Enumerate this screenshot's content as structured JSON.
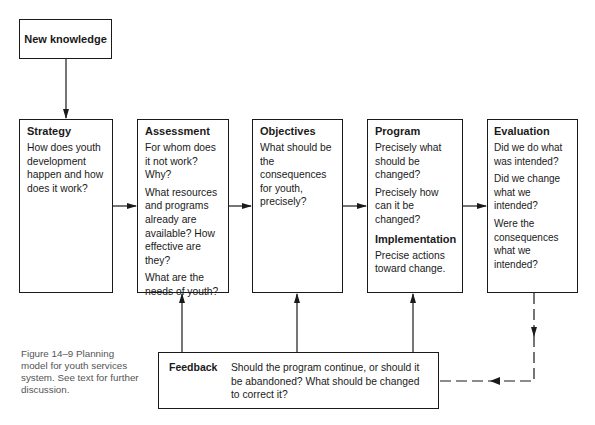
{
  "diagram": {
    "source": {
      "label": "New knowledge"
    },
    "stages": [
      {
        "title": "Strategy",
        "paragraphs": [
          "How does youth development happen and how does it work?"
        ]
      },
      {
        "title": "Assessment",
        "paragraphs": [
          "For whom does it not work? Why?",
          "What resources and programs already are available? How effective are they?",
          "What are the needs of youth?"
        ]
      },
      {
        "title": "Objectives",
        "paragraphs": [
          "What should be the consequences for youth, precisely?"
        ]
      },
      {
        "title": "Program",
        "paragraphs": [
          "Precisely what should be changed?",
          "Precisely how can it be changed?"
        ],
        "subsection": {
          "title": "Implementation",
          "paragraphs": [
            "Precise actions toward change."
          ]
        }
      },
      {
        "title": "Evaluation",
        "paragraphs": [
          "Did we do what was intended?",
          "Did we change what we intended?",
          "Were the consequences what we intended?"
        ]
      }
    ],
    "feedback": {
      "label": "Feedback",
      "text": "Should the program continue, or should it be abandoned? What should be changed to correct it?"
    },
    "edges": [
      {
        "from": "New knowledge",
        "to": "Strategy",
        "style": "solid"
      },
      {
        "from": "Strategy",
        "to": "Assessment",
        "style": "solid"
      },
      {
        "from": "Assessment",
        "to": "Objectives",
        "style": "solid"
      },
      {
        "from": "Objectives",
        "to": "Program",
        "style": "solid"
      },
      {
        "from": "Program",
        "to": "Evaluation",
        "style": "solid"
      },
      {
        "from": "Evaluation",
        "to": "Feedback",
        "style": "dashed"
      },
      {
        "from": "Feedback",
        "to": "Assessment",
        "style": "solid"
      },
      {
        "from": "Feedback",
        "to": "Objectives",
        "style": "solid"
      },
      {
        "from": "Feedback",
        "to": "Program",
        "style": "solid"
      }
    ]
  },
  "caption": "Figure 14–9  Planning model for youth services system. See text for further discussion.",
  "colors": {
    "line": "#1a1a1a",
    "caption_text": "#555555"
  }
}
